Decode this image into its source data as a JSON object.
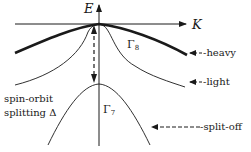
{
  "diagram": {
    "axes": {
      "x_label": "K",
      "y_label": "E"
    },
    "bands": [
      {
        "name": "heavy",
        "label": "heavy",
        "pointer": "←-heavy",
        "style": "thick"
      },
      {
        "name": "light",
        "label": "light",
        "pointer": "←-light",
        "style": "thin"
      },
      {
        "name": "split-off",
        "label": "split-off",
        "pointer": "←-------split-off",
        "style": "thin"
      }
    ],
    "symmetry_labels": {
      "gamma8": "Γ",
      "gamma8_sub": "8",
      "gamma7": "Γ",
      "gamma7_sub": "7"
    },
    "annotation": {
      "line1": "spin-orbit",
      "line2": "splitting Δ"
    },
    "colors": {
      "line": "#1a1a1a",
      "background": "#ffffff"
    }
  }
}
